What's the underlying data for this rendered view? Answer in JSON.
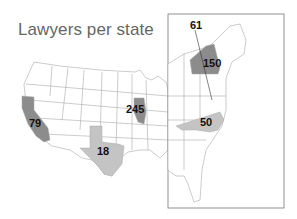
{
  "title": "Lawyers per state",
  "colors": {
    "dark_fill": "#8c8c8c",
    "light_fill": "#c4c4c4",
    "border": "#aaaaaa",
    "inset_frame": "#777777"
  },
  "states": [
    {
      "state": "California",
      "value": "79",
      "shade": "dark"
    },
    {
      "state": "Texas",
      "value": "18",
      "shade": "light"
    },
    {
      "state": "Illinois",
      "value": "245",
      "shade": "dark"
    },
    {
      "state": "New York",
      "value": "150",
      "shade": "dark"
    },
    {
      "state": "North Carolina",
      "value": "50",
      "shade": "light"
    },
    {
      "state": "District of Columbia",
      "value": "61",
      "shade": "none"
    }
  ]
}
